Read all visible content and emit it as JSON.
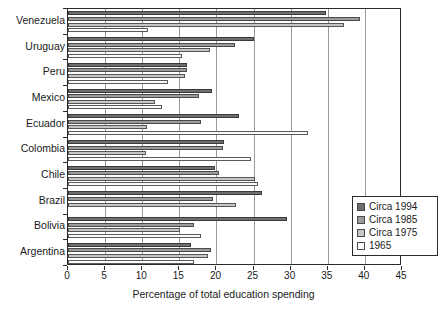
{
  "chart_data": {
    "type": "bar",
    "orientation": "horizontal",
    "title": "",
    "xlabel": "Percentage of total education spending",
    "ylabel": "",
    "xlim": [
      0,
      45
    ],
    "xticks": [
      0,
      5,
      10,
      15,
      20,
      25,
      30,
      35,
      40,
      45
    ],
    "grid": "vertical",
    "legend_position": "right-inside",
    "categories": [
      "Venezuela",
      "Uruguay",
      "Peru",
      "Mexico",
      "Ecuador",
      "Colombia",
      "Chile",
      "Brazil",
      "Bolivia",
      "Argentina"
    ],
    "series": [
      {
        "name": "Circa 1994",
        "color": "#6e6e6e",
        "values": [
          34.8,
          25.0,
          16.1,
          19.4,
          23.0,
          21.0,
          19.8,
          26.2,
          29.5,
          16.6
        ]
      },
      {
        "name": "Circa 1985",
        "color": "#9b9b9b",
        "values": [
          39.3,
          22.5,
          16.1,
          17.7,
          17.9,
          20.9,
          20.4,
          19.6,
          17.0,
          19.2
        ]
      },
      {
        "name": "Circa 1975",
        "color": "#c6c6c6",
        "values": [
          37.2,
          19.1,
          15.7,
          11.7,
          10.7,
          10.5,
          25.2,
          22.7,
          15.1,
          18.8
        ]
      },
      {
        "name": "1965",
        "color": "#fbfbfb",
        "values": [
          10.8,
          15.3,
          13.5,
          12.6,
          32.3,
          24.6,
          25.6,
          null,
          17.9,
          17.0
        ]
      }
    ]
  },
  "legend": {
    "items": [
      {
        "label": "Circa 1994"
      },
      {
        "label": "Circa 1985"
      },
      {
        "label": "Circa 1975"
      },
      {
        "label": "1965"
      }
    ]
  }
}
